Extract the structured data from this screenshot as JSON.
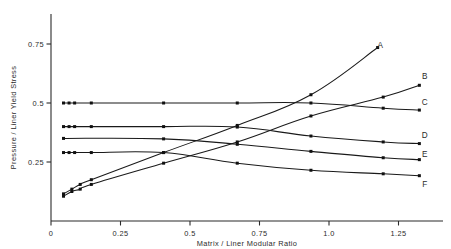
{
  "chart_data": {
    "type": "line",
    "title": "",
    "xlabel": "Matrix / Liner Modular Ratio",
    "ylabel": "Pressure / Liner Yield Stress",
    "xlim": [
      0.0,
      1.37
    ],
    "ylim": [
      0.0,
      0.88
    ],
    "grid": false,
    "legend_position": "right-end-labels",
    "xticks": [
      0,
      0.25,
      0.5,
      0.75,
      1.0,
      1.25
    ],
    "xtick_labels": [
      "0",
      "0.25",
      "0.5",
      "0.75",
      "1.0",
      "1.25"
    ],
    "yticks": [
      0.25,
      0.5,
      0.75
    ],
    "ytick_labels": [
      "0.25",
      "0.5",
      "0.75"
    ],
    "series": [
      {
        "name": "A",
        "label": "A",
        "label_x": 1.185,
        "label_y": 0.745,
        "x": [
          0.045,
          0.075,
          0.105,
          0.145,
          0.405,
          0.67,
          0.935,
          1.175
        ],
        "y": [
          0.115,
          0.135,
          0.155,
          0.175,
          0.29,
          0.405,
          0.535,
          0.735
        ]
      },
      {
        "name": "B",
        "label": "B",
        "label_x": 1.345,
        "label_y": 0.615,
        "x": [
          0.045,
          0.075,
          0.105,
          0.145,
          0.405,
          0.67,
          0.935,
          1.195,
          1.325
        ],
        "y": [
          0.105,
          0.125,
          0.135,
          0.155,
          0.245,
          0.335,
          0.445,
          0.525,
          0.575
        ]
      },
      {
        "name": "C",
        "label": "C",
        "label_x": 1.345,
        "label_y": 0.505,
        "x": [
          0.045,
          0.065,
          0.085,
          0.145,
          0.405,
          0.67,
          0.935,
          1.195,
          1.325
        ],
        "y": [
          0.5,
          0.5,
          0.5,
          0.5,
          0.5,
          0.5,
          0.5,
          0.478,
          0.47
        ]
      },
      {
        "name": "D",
        "label": "D",
        "label_x": 1.345,
        "label_y": 0.365,
        "x": [
          0.045,
          0.065,
          0.085,
          0.145,
          0.405,
          0.67,
          0.935,
          1.195,
          1.325
        ],
        "y": [
          0.4,
          0.4,
          0.4,
          0.4,
          0.4,
          0.398,
          0.36,
          0.335,
          0.328
        ]
      },
      {
        "name": "E",
        "label": "E",
        "label_x": 1.345,
        "label_y": 0.285,
        "x": [
          0.045,
          0.405,
          0.67,
          0.935,
          1.195,
          1.325
        ],
        "y": [
          0.35,
          0.348,
          0.325,
          0.295,
          0.268,
          0.26
        ]
      },
      {
        "name": "F",
        "label": "F",
        "label_x": 1.345,
        "label_y": 0.155,
        "x": [
          0.045,
          0.065,
          0.085,
          0.145,
          0.405,
          0.67,
          0.935,
          1.195,
          1.325
        ],
        "y": [
          0.29,
          0.29,
          0.29,
          0.29,
          0.29,
          0.245,
          0.215,
          0.2,
          0.192
        ]
      }
    ]
  }
}
